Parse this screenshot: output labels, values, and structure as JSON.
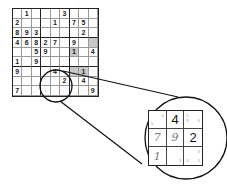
{
  "figure": {
    "colors": {
      "line": "#222222",
      "shade": "#c8c8c8",
      "pencil": "#aaaaaa"
    }
  },
  "grid": {
    "rows": [
      [
        {
          "v": "",
          "p": true
        },
        {
          "v": "1"
        },
        {
          "v": "",
          "p": true
        },
        {
          "v": ""
        },
        {
          "v": "",
          "p": true
        },
        {
          "v": "3"
        },
        {
          "v": "",
          "p": true
        },
        {
          "v": "",
          "p": true
        },
        {
          "v": "",
          "p": true
        }
      ],
      [
        {
          "v": "2"
        },
        {
          "v": "",
          "p": true
        },
        {
          "v": "",
          "p": true
        },
        {
          "v": "",
          "p": true
        },
        {
          "v": "1"
        },
        {
          "v": "",
          "p": true
        },
        {
          "v": "7"
        },
        {
          "v": "5"
        },
        {
          "v": "",
          "p": true
        }
      ],
      [
        {
          "v": "8"
        },
        {
          "v": "9"
        },
        {
          "v": "3"
        },
        {
          "v": ""
        },
        {
          "v": "",
          "p": true
        },
        {
          "v": "",
          "p": true
        },
        {
          "v": "",
          "p": true
        },
        {
          "v": "2"
        },
        {
          "v": "",
          "p": true
        }
      ],
      [
        {
          "v": "4"
        },
        {
          "v": "6"
        },
        {
          "v": "8"
        },
        {
          "v": "2"
        },
        {
          "v": "7"
        },
        {
          "v": "",
          "p": true
        },
        {
          "v": "9"
        },
        {
          "v": "",
          "p": true
        },
        {
          "v": "",
          "p": true,
          "s": true
        }
      ],
      [
        {
          "v": "",
          "p": true
        },
        {
          "v": "",
          "p": true
        },
        {
          "v": "5"
        },
        {
          "v": "9"
        },
        {
          "v": ""
        },
        {
          "v": ""
        },
        {
          "v": "1",
          "s": true
        },
        {
          "v": "",
          "p": true
        },
        {
          "v": "4"
        }
      ],
      [
        {
          "v": "1"
        },
        {
          "v": "",
          "p": true
        },
        {
          "v": "9"
        },
        {
          "v": "",
          "p": true
        },
        {
          "v": ""
        },
        {
          "v": ""
        },
        {
          "v": "",
          "p": true
        },
        {
          "v": "",
          "p": true
        },
        {
          "v": "",
          "p": true
        }
      ],
      [
        {
          "v": "9"
        },
        {
          "v": ""
        },
        {
          "v": "",
          "p": true
        },
        {
          "v": ""
        },
        {
          "v": "4"
        },
        {
          "v": ""
        },
        {
          "v": "",
          "p": true,
          "s": true
        },
        {
          "v": "1",
          "s": true
        },
        {
          "v": "",
          "p": true
        }
      ],
      [
        {
          "v": "",
          "p": true
        },
        {
          "v": "",
          "p": true
        },
        {
          "v": ""
        },
        {
          "v": "",
          "p": true
        },
        {
          "v": "",
          "p": true
        },
        {
          "v": "2"
        },
        {
          "v": "",
          "p": true
        },
        {
          "v": "4"
        },
        {
          "v": "",
          "p": true
        }
      ],
      [
        {
          "v": "7"
        },
        {
          "v": ""
        },
        {
          "v": "",
          "p": true
        },
        {
          "v": "1",
          "p": true
        },
        {
          "v": ""
        },
        {
          "v": ""
        },
        {
          "v": ""
        },
        {
          "v": "",
          "p": true
        },
        {
          "v": "9"
        }
      ]
    ]
  },
  "inset": {
    "cells": [
      {
        "big": "",
        "hand": "",
        "notes": [
          {
            "pos": "tr",
            "t": "6"
          },
          {
            "pos": "bl",
            "t": "5"
          }
        ]
      },
      {
        "big": "4",
        "hand": "",
        "notes": []
      },
      {
        "big": "",
        "hand": "",
        "notes": [
          {
            "pos": "tl",
            "t": "5"
          },
          {
            "pos": "ml",
            "t": "8"
          },
          {
            "pos": "mr",
            "t": "6"
          }
        ]
      },
      {
        "big": "",
        "hand": "7",
        "notes": []
      },
      {
        "big": "",
        "hand": "9",
        "notes": []
      },
      {
        "big": "2",
        "hand": "",
        "notes": []
      },
      {
        "big": "",
        "hand": "1",
        "notes": []
      },
      {
        "big": "",
        "hand": "",
        "notes": [
          {
            "pos": "br2",
            "t": "3"
          }
        ]
      },
      {
        "big": "",
        "hand": "",
        "notes": [
          {
            "pos": "tr",
            "t": "6"
          },
          {
            "pos": "bl",
            "t": "3"
          },
          {
            "pos": "br2",
            "t": "5"
          }
        ]
      }
    ]
  }
}
